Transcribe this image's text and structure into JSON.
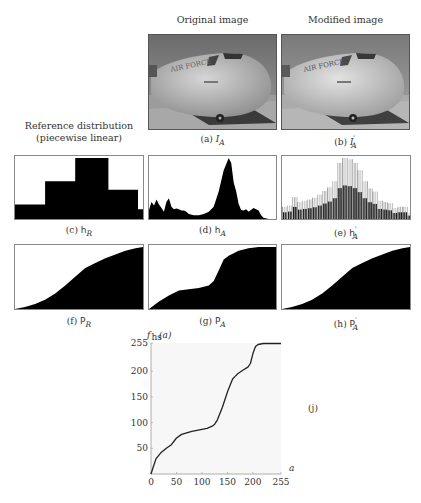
{
  "figure": {
    "column_titles": {
      "original": "Original image",
      "modified": "Modified image"
    },
    "reference_title": {
      "line1": "Reference distribution",
      "line2": "(piecewise linear)"
    },
    "captions": {
      "a": "(a) I_A",
      "b": "(b) I'_A",
      "c": "(c) h_R",
      "d": "(d) h_A",
      "e": "(e) h'_A",
      "f": "(f) P_R",
      "g": "(g) P_A",
      "h": "(h) P'_A",
      "j": "(j)"
    },
    "caption_parts": {
      "a": {
        "tag": "(a)",
        "sym": "I",
        "sub": "A",
        "prime": ""
      },
      "b": {
        "tag": "(b)",
        "sym": "I",
        "sub": "A",
        "prime": "′"
      },
      "c": {
        "tag": "(c)",
        "sym": "h",
        "sub": "R",
        "prime": ""
      },
      "d": {
        "tag": "(d)",
        "sym": "h",
        "sub": "A",
        "prime": ""
      },
      "e": {
        "tag": "(e)",
        "sym": "h",
        "sub": "A",
        "prime": "′"
      },
      "f": {
        "tag": "(f)",
        "sym": "P",
        "sub": "R",
        "prime": ""
      },
      "g": {
        "tag": "(g)",
        "sym": "P",
        "sub": "A",
        "prime": ""
      },
      "h": {
        "tag": "(h)",
        "sym": "P",
        "sub": "A",
        "prime": "′"
      },
      "j": {
        "tag": "(j)"
      }
    },
    "images": {
      "a": "aircraft-nose-original",
      "b": "aircraft-nose-modified"
    }
  },
  "chart_data": [
    {
      "id": "c",
      "type": "area",
      "title": "h_R (reference distribution, piecewise)",
      "x": [
        0,
        60,
        60,
        120,
        120,
        186,
        186,
        245,
        245,
        255
      ],
      "values": [
        0.24,
        0.24,
        0.62,
        0.62,
        1.0,
        1.0,
        0.48,
        0.48,
        0.16,
        0.16
      ]
    },
    {
      "id": "d",
      "type": "area",
      "title": "h_A (original histogram)",
      "x": [
        0,
        5,
        10,
        15,
        20,
        25,
        30,
        35,
        40,
        45,
        50,
        55,
        60,
        65,
        70,
        75,
        80,
        90,
        100,
        110,
        120,
        130,
        140,
        150,
        160,
        165,
        170,
        175,
        180,
        185,
        190,
        195,
        200,
        210,
        220,
        225,
        230,
        240,
        255
      ],
      "values": [
        0.15,
        0.28,
        0.22,
        0.32,
        0.24,
        0.18,
        0.12,
        0.28,
        0.34,
        0.2,
        0.16,
        0.17,
        0.16,
        0.14,
        0.14,
        0.12,
        0.08,
        0.06,
        0.06,
        0.08,
        0.12,
        0.2,
        0.45,
        0.8,
        1.0,
        0.92,
        0.6,
        0.45,
        0.25,
        0.15,
        0.14,
        0.16,
        0.12,
        0.18,
        0.14,
        0.06,
        0.02,
        0,
        0
      ]
    },
    {
      "id": "e",
      "type": "bar",
      "title": "h'_A (modified histogram, comb-like)",
      "x": [
        0,
        10,
        20,
        30,
        40,
        50,
        60,
        70,
        80,
        90,
        100,
        110,
        120,
        130,
        140,
        150,
        160,
        170,
        180,
        190,
        200,
        210,
        220,
        230,
        240,
        250
      ],
      "values": [
        0.2,
        0.22,
        0.36,
        0.28,
        0.3,
        0.32,
        0.35,
        0.4,
        0.46,
        0.52,
        0.62,
        0.92,
        1.0,
        0.98,
        0.92,
        0.8,
        0.62,
        0.5,
        0.45,
        0.3,
        0.28,
        0.26,
        0.18,
        0.2,
        0.2,
        0.1
      ]
    },
    {
      "id": "f",
      "type": "area",
      "title": "P_R (reference cumulative)",
      "x": [
        0,
        20,
        40,
        60,
        80,
        100,
        120,
        140,
        160,
        180,
        200,
        220,
        240,
        255
      ],
      "values": [
        0,
        0.03,
        0.08,
        0.15,
        0.25,
        0.38,
        0.52,
        0.66,
        0.74,
        0.82,
        0.88,
        0.94,
        0.98,
        1.0
      ]
    },
    {
      "id": "g",
      "type": "area",
      "title": "P_A (original cumulative)",
      "x": [
        0,
        20,
        40,
        60,
        80,
        100,
        120,
        130,
        140,
        150,
        160,
        170,
        180,
        200,
        220,
        240,
        255
      ],
      "values": [
        0,
        0.12,
        0.22,
        0.3,
        0.32,
        0.34,
        0.38,
        0.45,
        0.62,
        0.8,
        0.86,
        0.9,
        0.94,
        0.98,
        1.0,
        1.0,
        1.0
      ]
    },
    {
      "id": "h",
      "type": "area",
      "title": "P'_A (modified cumulative)",
      "x": [
        0,
        20,
        40,
        60,
        80,
        100,
        120,
        140,
        160,
        180,
        200,
        220,
        240,
        255
      ],
      "values": [
        0,
        0.03,
        0.08,
        0.15,
        0.25,
        0.38,
        0.52,
        0.66,
        0.74,
        0.82,
        0.88,
        0.94,
        0.98,
        1.0
      ]
    },
    {
      "id": "j",
      "type": "line",
      "title": "",
      "xlabel": "a",
      "ylabel": "f_hs(a)",
      "xlim": [
        0,
        255
      ],
      "ylim": [
        0,
        255
      ],
      "xticks": [
        0,
        50,
        100,
        150,
        200,
        255
      ],
      "yticks": [
        50,
        100,
        150,
        200,
        255
      ],
      "x": [
        0,
        5,
        10,
        20,
        30,
        40,
        50,
        60,
        70,
        80,
        90,
        100,
        110,
        120,
        125,
        130,
        140,
        150,
        160,
        165,
        170,
        180,
        190,
        195,
        200,
        205,
        210,
        220,
        230,
        240,
        255
      ],
      "y": [
        0,
        15,
        30,
        42,
        50,
        57,
        70,
        77,
        80,
        83,
        85,
        87,
        89,
        93,
        97,
        105,
        130,
        160,
        185,
        190,
        195,
        202,
        208,
        215,
        235,
        248,
        252,
        254,
        254,
        254,
        254
      ]
    }
  ]
}
